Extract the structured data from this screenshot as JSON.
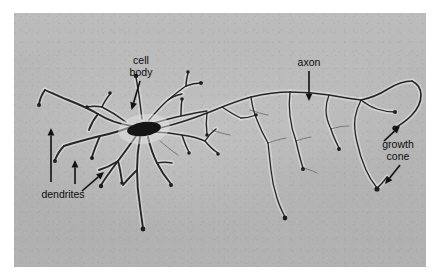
{
  "figure": {
    "kind": "light-micrograph",
    "plate": {
      "background_color": "#b6b6b6",
      "page_color": "#ffffff",
      "left": 14,
      "top": 13,
      "width": 412,
      "height": 254
    },
    "ink_color": "#262626",
    "soma_color": "#151515",
    "label_color": "#0d0d0d"
  },
  "annotations": [
    {
      "id": "cell-body",
      "label_lines": [
        "cell",
        "body"
      ],
      "text": "cell body",
      "text_x": 141,
      "text_line_y": [
        64,
        76
      ],
      "pointers": [
        {
          "x1": 140,
          "y1": 81,
          "x2": 131.5,
          "y2": 110
        }
      ]
    },
    {
      "id": "dendrites",
      "label_lines": [
        "dendrites"
      ],
      "text": "dendrites",
      "text_x": 63,
      "text_line_y": [
        198
      ],
      "pointers": [
        {
          "x1": 51,
          "y1": 182,
          "x2": 51,
          "y2": 128
        },
        {
          "x1": 75,
          "y1": 184,
          "x2": 75,
          "y2": 160
        },
        {
          "x1": 82,
          "y1": 191,
          "x2": 104,
          "y2": 172
        }
      ]
    },
    {
      "id": "axon",
      "label_lines": [
        "axon"
      ],
      "text": "axon",
      "text_x": 309,
      "text_line_y": [
        66
      ],
      "pointers": [
        {
          "x1": 309,
          "y1": 71,
          "x2": 309,
          "y2": 101
        }
      ]
    },
    {
      "id": "growth-cone",
      "label_lines": [
        "growth",
        "cone"
      ],
      "text": "growth cone",
      "text_x": 398,
      "text_line_y": [
        148,
        160
      ],
      "pointers": [
        {
          "x1": 384,
          "y1": 141,
          "x2": 400,
          "y2": 126
        },
        {
          "x1": 400,
          "y1": 165,
          "x2": 385,
          "y2": 184
        }
      ]
    }
  ],
  "morphology": {
    "soma": {
      "cx": 144,
      "cy": 129,
      "rx": 17,
      "ry": 7,
      "rotation": -8
    },
    "dendrite_paths": [
      "M132,126 C118,124 106,119 98,114 C88,108 78,104 68,100 C60,97 52,93 45,90",
      "M45,90 C42,94 40,99 39,104",
      "M98,114 C94,119 91,124 89,130",
      "M131,127 C120,131 110,134 100,136 C88,139 76,142 64,146",
      "M64,146 C60,150 57,155 55,160",
      "M100,136 C97,143 94,150 92,157",
      "M136,136 C130,145 124,153 118,161 C112,169 106,177 101,185",
      "M118,161 C112,165 106,168 99,170",
      "M118,161 C120,168 121,175 122,182",
      "M140,137 C138,148 137,159 137,170 C137,182 138,194 140,206 C141,214 142,221 143,228",
      "M137,170 C132,175 127,180 123,185",
      "M148,137 C150,146 153,155 157,163 C161,171 166,178 171,184",
      "M157,163 C162,162 167,162 172,163",
      "M152,132 C162,132 172,133 182,135 C190,136 198,138 205,141",
      "M182,135 C184,141 186,147 189,152",
      "M205,141 C208,136 212,132 216,129",
      "M205,141 C209,146 213,150 218,153",
      "M151,124 C161,121 171,118 181,116 C190,114 199,112 207,111",
      "M181,116 C181,110 181,105 182,100",
      "M142,119 C141,111 140,103 139,95 C138,89 137,83 136,77",
      "M149,120 C155,113 161,106 168,100 C174,95 180,90 186,86",
      "M168,100 C172,97 177,95 182,94",
      "M186,86 C191,84 196,83 201,83",
      "M186,86 C186,81 187,77 188,73",
      "M126,122 C118,116 110,111 102,107",
      "M102,107 C97,106 92,106 87,107",
      "M102,107 C104,102 107,98 110,94"
    ],
    "axon_paths": [
      "M160,128 C176,124 192,119 207,113 C222,107 236,101 251,97 C264,94 277,92 290,92",
      "M290,92 C303,92 316,93 329,95 C340,97 351,99 361,100",
      "M361,100 C371,98 380,94 388,89 C396,84 404,81 412,81",
      "M412,81 C418,84 421,89 421,95 C421,103 417,110 411,116 C406,121 400,125 395,128",
      "M361,100 C358,106 356,112 355,118 C354,126 355,134 357,142 C359,152 362,161 366,170 C369,177 373,183 377,188",
      "M377,188 C381,185 384,181 387,177",
      "M251,97 C252,105 254,113 257,120 C260,128 264,136 268,143",
      "M268,143 C269,152 270,161 271,170 C272,180 274,189 277,198 C279,205 282,211 285,217",
      "M290,92 C289,100 289,108 290,116 C291,125 293,133 296,141",
      "M296,141 C298,150 300,159 303,168",
      "M329,95 C327,100 326,105 326,110 C326,117 328,123 331,129",
      "M331,129 C333,136 336,142 339,148",
      "M222,107 C228,111 234,115 241,118",
      "M241,118 C246,118 251,117 256,115",
      "M207,113 C206,120 206,127 207,134",
      "M361,100 C366,104 371,107 377,109 C383,111 389,112 395,112"
    ],
    "faint_paths": [
      "M268,143 C274,141 280,139 286,138",
      "M303,168 C308,169 313,171 317,173",
      "M331,129 C337,127 343,126 349,126",
      "M296,141 C301,139 306,138 311,137",
      "M212,130 C218,132 224,134 230,135",
      "M160,141 C166,146 172,151 178,155",
      "M250,110 C256,112 262,114 268,115"
    ],
    "boutons": [
      {
        "cx": 39,
        "cy": 105,
        "r": 2.0
      },
      {
        "cx": 55,
        "cy": 161,
        "r": 2.0
      },
      {
        "cx": 92,
        "cy": 158,
        "r": 2.0
      },
      {
        "cx": 101,
        "cy": 186,
        "r": 2.2
      },
      {
        "cx": 122,
        "cy": 183,
        "r": 1.8
      },
      {
        "cx": 143,
        "cy": 229,
        "r": 2.4
      },
      {
        "cx": 171,
        "cy": 185,
        "r": 2.0
      },
      {
        "cx": 189,
        "cy": 153,
        "r": 1.8
      },
      {
        "cx": 218,
        "cy": 154,
        "r": 1.8
      },
      {
        "cx": 136,
        "cy": 76,
        "r": 2.2
      },
      {
        "cx": 182,
        "cy": 99,
        "r": 1.8
      },
      {
        "cx": 201,
        "cy": 83,
        "r": 2.0
      },
      {
        "cx": 188,
        "cy": 72,
        "r": 1.8
      },
      {
        "cx": 110,
        "cy": 93,
        "r": 1.8
      },
      {
        "cx": 87,
        "cy": 107,
        "r": 1.8
      },
      {
        "cx": 285,
        "cy": 218,
        "r": 2.4
      },
      {
        "cx": 339,
        "cy": 149,
        "r": 2.0
      },
      {
        "cx": 303,
        "cy": 169,
        "r": 2.0
      },
      {
        "cx": 207,
        "cy": 135,
        "r": 1.8
      },
      {
        "cx": 395,
        "cy": 128,
        "r": 2.6
      },
      {
        "cx": 377,
        "cy": 189,
        "r": 2.6
      },
      {
        "cx": 256,
        "cy": 115,
        "r": 1.8
      },
      {
        "cx": 395,
        "cy": 112,
        "r": 2.0
      }
    ]
  }
}
